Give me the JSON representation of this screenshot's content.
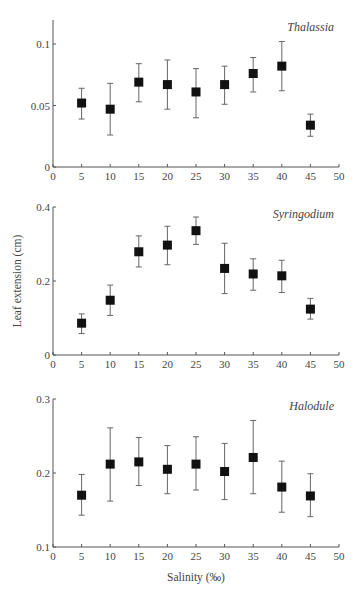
{
  "chart_data": [
    {
      "type": "scatter",
      "title": "Thalassia",
      "xlabel": "",
      "ylabel": "",
      "xlim": [
        0,
        50
      ],
      "ylim": [
        0,
        0.12
      ],
      "xticks": [
        0,
        5,
        10,
        15,
        20,
        25,
        30,
        35,
        40,
        45,
        50
      ],
      "yticks": [
        0,
        0.05,
        0.1
      ],
      "ytick_labels": [
        "0",
        "0.05",
        "0.1"
      ],
      "grid": false,
      "x": [
        5,
        10,
        15,
        20,
        25,
        30,
        35,
        40,
        45
      ],
      "values": [
        0.052,
        0.047,
        0.069,
        0.067,
        0.061,
        0.067,
        0.076,
        0.082,
        0.034
      ],
      "err_low": [
        0.039,
        0.026,
        0.053,
        0.047,
        0.04,
        0.051,
        0.061,
        0.062,
        0.025
      ],
      "err_high": [
        0.064,
        0.068,
        0.084,
        0.087,
        0.08,
        0.082,
        0.089,
        0.102,
        0.043
      ],
      "marker": "filled-square"
    },
    {
      "type": "scatter",
      "title": "Syringodium",
      "xlabel": "",
      "ylabel": "Leaf extension (cm)",
      "xlim": [
        0,
        50
      ],
      "ylim": [
        0,
        0.4
      ],
      "xticks": [
        0,
        5,
        10,
        15,
        20,
        25,
        30,
        35,
        40,
        45,
        50
      ],
      "yticks": [
        0,
        0.2,
        0.4
      ],
      "ytick_labels": [
        "0",
        "0.2",
        "0.4"
      ],
      "grid": false,
      "x": [
        5,
        10,
        15,
        20,
        25,
        30,
        35,
        40,
        45
      ],
      "values": [
        0.086,
        0.148,
        0.279,
        0.297,
        0.336,
        0.234,
        0.219,
        0.214,
        0.124
      ],
      "err_low": [
        0.058,
        0.107,
        0.238,
        0.244,
        0.299,
        0.166,
        0.175,
        0.169,
        0.097
      ],
      "err_high": [
        0.111,
        0.189,
        0.322,
        0.348,
        0.373,
        0.302,
        0.26,
        0.256,
        0.153
      ],
      "marker": "filled-square"
    },
    {
      "type": "scatter",
      "title": "Halodule",
      "xlabel": "Salinity (‰)",
      "ylabel": "",
      "xlim": [
        0,
        50
      ],
      "ylim": [
        0.1,
        0.3
      ],
      "xticks": [
        0,
        5,
        10,
        15,
        20,
        25,
        30,
        35,
        40,
        45,
        50
      ],
      "yticks": [
        0.1,
        0.2,
        0.3
      ],
      "ytick_labels": [
        "0.1",
        "0.2",
        "0.3"
      ],
      "grid": false,
      "x": [
        5,
        10,
        15,
        20,
        25,
        30,
        35,
        40,
        45
      ],
      "values": [
        0.17,
        0.212,
        0.215,
        0.205,
        0.212,
        0.202,
        0.221,
        0.181,
        0.169
      ],
      "err_low": [
        0.143,
        0.162,
        0.183,
        0.172,
        0.177,
        0.164,
        0.172,
        0.147,
        0.141
      ],
      "err_high": [
        0.198,
        0.261,
        0.248,
        0.237,
        0.249,
        0.24,
        0.271,
        0.216,
        0.199
      ],
      "marker": "filled-square"
    }
  ],
  "labels": {
    "ylabel": "Leaf extension (cm)",
    "xlabel": "Salinity (‰)",
    "xlabel_display": "Salinity (‰)"
  },
  "layout": {
    "x_left_px": 53,
    "x_right_px": 339,
    "panels": [
      {
        "y_top_px": 20,
        "y_bottom_px": 167
      },
      {
        "y_top_px": 207,
        "y_bottom_px": 355
      },
      {
        "y_top_px": 399,
        "y_bottom_px": 547
      }
    ]
  }
}
